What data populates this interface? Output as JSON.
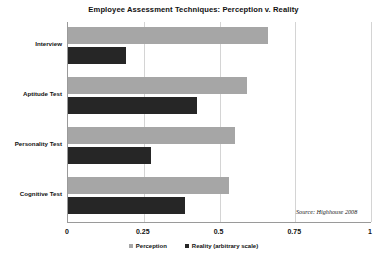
{
  "chart_data": {
    "type": "bar",
    "orientation": "horizontal",
    "title": "Employee Assessment Techniques: Perception v. Reality",
    "xlabel": "",
    "ylabel": "",
    "xlim": [
      0,
      1
    ],
    "xticks": [
      "0",
      "0.25",
      "0.5",
      "0.75",
      "1"
    ],
    "xtick_values": [
      0,
      0.25,
      0.5,
      0.75,
      1
    ],
    "grid": "vertical",
    "legend_position": "bottom",
    "categories": [
      "Interview",
      "Aptitude Test",
      "Personality Test",
      "Cognitive Test"
    ],
    "series": [
      {
        "name": "Perception",
        "color": "#a6a6a6",
        "values": [
          0.66,
          0.59,
          0.55,
          0.53
        ]
      },
      {
        "name": "Reality (arbitrary scale)",
        "color": "#262626",
        "values": [
          0.19,
          0.425,
          0.275,
          0.385
        ]
      }
    ],
    "annotations": [
      {
        "text": "Source: Highhouse 2008"
      }
    ]
  },
  "source_note": "Source: Highhouse 2008",
  "colors": {
    "perception": "#a6a6a6",
    "reality": "#262626",
    "axis": "#9a9a9a",
    "gridline": "#d4d4d4",
    "background": "#ffffff"
  }
}
